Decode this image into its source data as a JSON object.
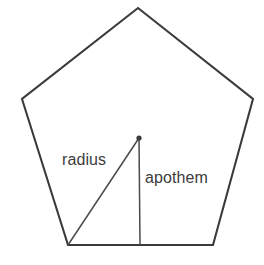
{
  "figure": {
    "background_color": "#ffffff",
    "stroke_color": "#3b3b3b",
    "segment_color": "#4a4a4a",
    "text_color": "#3c3c3c",
    "canvas": {
      "width": 264,
      "height": 265
    },
    "shape": {
      "name": "pentagon",
      "sides": 5,
      "points_attr": "138,8 253,99 213,245 68,245 22,99",
      "vertices": [
        {
          "name": "apex",
          "x": 138,
          "y": 8
        },
        {
          "name": "right",
          "x": 253,
          "y": 99
        },
        {
          "name": "bottom-right",
          "x": 213,
          "y": 245
        },
        {
          "name": "bottom-left",
          "x": 68,
          "y": 245
        },
        {
          "name": "left",
          "x": 22,
          "y": 99
        }
      ]
    },
    "center": {
      "x": 139,
      "y": 138,
      "dot_radius": 2.6
    },
    "segments": [
      {
        "id": "radius",
        "label": "radius",
        "from": {
          "x": 139,
          "y": 138
        },
        "to": {
          "x": 68,
          "y": 245
        },
        "description": "segment from center to a vertex"
      },
      {
        "id": "apothem",
        "label": "apothem",
        "from": {
          "x": 139,
          "y": 138
        },
        "to": {
          "x": 140,
          "y": 245
        },
        "description": "perpendicular segment from center to the midpoint of a side"
      }
    ],
    "labels": {
      "radius": "radius",
      "apothem": "apothem"
    }
  }
}
